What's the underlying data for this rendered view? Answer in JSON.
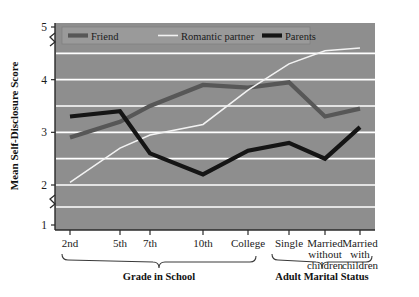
{
  "chart_data": {
    "type": "line",
    "title": "",
    "xlabel": "",
    "ylabel": "Mean Self-Disclosure Score",
    "ylim": [
      1,
      5
    ],
    "yticks": [
      1,
      2,
      3,
      4,
      5
    ],
    "y_axis_break": "between 1 and 2",
    "grid": "horizontal gridlines every 0.5 from 1.5 to 4.5, white",
    "legend_position": "top-left inside plot",
    "categories": [
      "2nd",
      "5th",
      "7th",
      "10th",
      "College",
      "Single",
      "Married without children",
      "Married with children"
    ],
    "category_labels_multiline": [
      [
        "2nd"
      ],
      [
        "5th"
      ],
      [
        "7th"
      ],
      [
        "10th"
      ],
      [
        "College"
      ],
      [
        "Single"
      ],
      [
        "Married",
        "without",
        "children"
      ],
      [
        "Married",
        "with",
        "children"
      ]
    ],
    "group_brackets": [
      {
        "label": "Grade in School",
        "categories": [
          "2nd",
          "5th",
          "7th",
          "10th",
          "College"
        ]
      },
      {
        "label": "Adult Marital Status",
        "categories": [
          "Single",
          "Married without children",
          "Married with children"
        ]
      }
    ],
    "series": [
      {
        "name": "Friend",
        "color": "#575757",
        "values": [
          2.9,
          3.2,
          3.5,
          3.9,
          3.85,
          3.95,
          3.3,
          3.45
        ]
      },
      {
        "name": "Romantic partner",
        "color": "#f2f2f2",
        "values": [
          2.05,
          2.7,
          2.95,
          3.15,
          3.8,
          4.3,
          4.55,
          4.6
        ]
      },
      {
        "name": "Parents",
        "color": "#151515",
        "values": [
          3.3,
          3.4,
          2.6,
          2.2,
          2.65,
          2.8,
          2.5,
          3.1
        ]
      }
    ]
  },
  "legend": {
    "items": [
      {
        "label": "Friend",
        "color": "#575757"
      },
      {
        "label": "Romantic partner",
        "color": "#f2f2f2"
      },
      {
        "label": "Parents",
        "color": "#151515"
      }
    ]
  },
  "axes": {
    "y_title": "Mean Self-Disclosure Score",
    "y_tick_labels": [
      "5",
      "4",
      "3",
      "2",
      "1"
    ]
  },
  "colors": {
    "plot_background": "#8e8e8e",
    "gridline": "#ffffff",
    "page_background": "#ffffff",
    "text": "#1b1b1b",
    "friend": "#575757",
    "romantic_partner": "#f2f2f2",
    "parents": "#151515"
  }
}
